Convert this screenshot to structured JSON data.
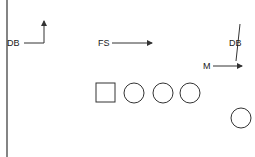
{
  "diagram": {
    "type": "football-play",
    "colors": {
      "stroke": "#333333",
      "text": "#1a1a1a",
      "background": "#ffffff"
    },
    "labels": [
      {
        "id": "db-left",
        "text": "DB",
        "x": 7,
        "y": 46
      },
      {
        "id": "fs",
        "text": "FS",
        "x": 98,
        "y": 46
      },
      {
        "id": "db-right",
        "text": "DB",
        "x": 229,
        "y": 46
      },
      {
        "id": "m",
        "text": "M",
        "x": 203,
        "y": 69
      }
    ],
    "routes": [
      {
        "id": "db-left-route",
        "points": "24,43 44,43 44,21",
        "arrow": "up"
      },
      {
        "id": "fs-route",
        "points": "112,43 152,43",
        "arrow": "right"
      },
      {
        "id": "db-right-route",
        "points": "240,24 236,61",
        "arrow": "none"
      },
      {
        "id": "m-route",
        "points": "213,66 242,66",
        "arrow": "right"
      }
    ],
    "offense": {
      "center": {
        "shape": "square",
        "x": 96,
        "y": 83,
        "size": 19
      },
      "players": [
        {
          "shape": "circle",
          "cx": 134,
          "cy": 93,
          "r": 10
        },
        {
          "shape": "circle",
          "cx": 163,
          "cy": 93,
          "r": 10
        },
        {
          "shape": "circle",
          "cx": 190,
          "cy": 93,
          "r": 10
        },
        {
          "shape": "circle",
          "cx": 241,
          "cy": 118,
          "r": 10
        }
      ]
    },
    "sideline": {
      "x": 7,
      "y1": 0,
      "y2": 157
    }
  }
}
